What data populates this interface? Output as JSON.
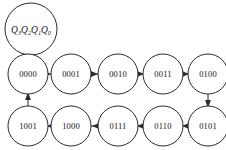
{
  "diagram": {
    "legend": {
      "name": "state-variable-legend",
      "text": "Q3Q2Q1Q0",
      "base": "Q",
      "subscripts": [
        "3",
        "2",
        "1",
        "0"
      ],
      "cx": 31,
      "cy": 29,
      "r": 26
    },
    "node_radius": 20,
    "colors": {
      "stroke": "#2b2b2b",
      "fill": "#ffffff",
      "text": "#141414",
      "background": "#ffffff"
    },
    "nodes": [
      {
        "id": "s0",
        "label": "0000",
        "cx": 28,
        "cy": 74
      },
      {
        "id": "s1",
        "label": "0001",
        "cx": 71,
        "cy": 74
      },
      {
        "id": "s2",
        "label": "0010",
        "cx": 118,
        "cy": 74
      },
      {
        "id": "s3",
        "label": "0011",
        "cx": 163,
        "cy": 74
      },
      {
        "id": "s4",
        "label": "0100",
        "cx": 208,
        "cy": 74
      },
      {
        "id": "s5",
        "label": "0101",
        "cx": 208,
        "cy": 126
      },
      {
        "id": "s6",
        "label": "0110",
        "cx": 163,
        "cy": 126
      },
      {
        "id": "s7",
        "label": "0111",
        "cx": 118,
        "cy": 126
      },
      {
        "id": "s8",
        "label": "1000",
        "cx": 71,
        "cy": 126
      },
      {
        "id": "s9",
        "label": "1001",
        "cx": 28,
        "cy": 126
      }
    ],
    "edges": [
      {
        "id": "e0",
        "from": "0000",
        "to": "0001",
        "direction": "right"
      },
      {
        "id": "e1",
        "from": "0001",
        "to": "0010",
        "direction": "right"
      },
      {
        "id": "e2",
        "from": "0010",
        "to": "0011",
        "direction": "right"
      },
      {
        "id": "e3",
        "from": "0011",
        "to": "0100",
        "direction": "right"
      },
      {
        "id": "e4",
        "from": "0100",
        "to": "0101",
        "direction": "down"
      },
      {
        "id": "e5",
        "from": "0101",
        "to": "0110",
        "direction": "left"
      },
      {
        "id": "e6",
        "from": "0110",
        "to": "0111",
        "direction": "left"
      },
      {
        "id": "e7",
        "from": "0111",
        "to": "1000",
        "direction": "left"
      },
      {
        "id": "e8",
        "from": "1000",
        "to": "1001",
        "direction": "left"
      },
      {
        "id": "e9",
        "from": "1001",
        "to": "0000",
        "direction": "up"
      }
    ]
  }
}
